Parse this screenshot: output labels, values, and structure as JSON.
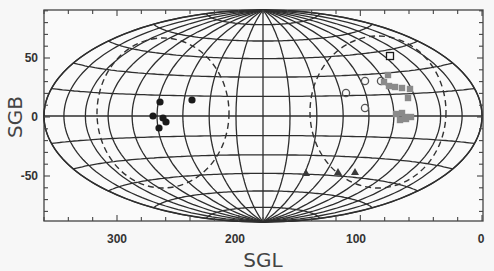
{
  "chart_data": {
    "type": "scatter",
    "projection": "aitoff-hammer (all-sky, elliptical)",
    "title": "",
    "xlabel": "SGL",
    "ylabel": "SGB",
    "xlim": [
      360,
      0
    ],
    "ylim": [
      -90,
      90
    ],
    "x_ticks": [
      300,
      200,
      100,
      0
    ],
    "y_ticks": [
      50,
      0,
      -50
    ],
    "x_tick_labels": [
      "300",
      "200",
      "100",
      "0"
    ],
    "y_tick_labels": [
      "50",
      "0",
      "-50"
    ],
    "grid": true,
    "grid_meridian_step_deg": 20,
    "grid_parallel_step_deg": 15,
    "legend": null,
    "dashed_regions": [
      {
        "name": "left-dashed-circle",
        "center_sgl": 262,
        "center_sgb": 0,
        "style": "dashed"
      },
      {
        "name": "right-dashed-circle",
        "center_sgl": 82,
        "center_sgb": 0,
        "style": "dashed"
      }
    ],
    "series": [
      {
        "name": "filled-black-circles",
        "marker": "filled-circle",
        "color": "#1a1a1a",
        "points_px": [
          [
            160,
            102
          ],
          [
            192,
            100
          ],
          [
            153,
            116
          ],
          [
            163,
            118
          ],
          [
            166,
            122
          ],
          [
            159,
            128
          ]
        ],
        "approx_sgl_sgb": [
          [
            268,
            13
          ],
          [
            240,
            15
          ],
          [
            273,
            0
          ],
          [
            265,
            -1
          ],
          [
            262,
            -5
          ],
          [
            268,
            -10
          ]
        ]
      },
      {
        "name": "open-circles",
        "marker": "open-circle",
        "color": "#555555",
        "points_px": [
          [
            365,
            81
          ],
          [
            381,
            81
          ],
          [
            346,
            93
          ],
          [
            365,
            108
          ]
        ],
        "approx_sgl_sgb": [
          [
            100,
            30
          ],
          [
            88,
            30
          ],
          [
            112,
            20
          ],
          [
            97,
            8
          ]
        ]
      },
      {
        "name": "open-square",
        "marker": "open-square",
        "color": "#1a1a1a",
        "points_px": [
          [
            390,
            56
          ]
        ],
        "approx_sgl_sgb": [
          [
            82,
            52
          ]
        ]
      },
      {
        "name": "gray-squares",
        "marker": "filled-square",
        "color": "#8a8a8a",
        "points_px": [
          [
            388,
            75
          ],
          [
            384,
            82
          ],
          [
            389,
            86
          ],
          [
            395,
            87
          ],
          [
            402,
            88
          ],
          [
            410,
            89
          ],
          [
            408,
            98
          ],
          [
            402,
            113
          ],
          [
            396,
            114
          ],
          [
            405,
            117
          ],
          [
            411,
            117
          ],
          [
            400,
            120
          ],
          [
            406,
            119
          ]
        ],
        "approx_sgl_sgb": [
          [
            80,
            35
          ],
          [
            84,
            29
          ],
          [
            80,
            26
          ],
          [
            74,
            25
          ],
          [
            68,
            24
          ],
          [
            60,
            23
          ],
          [
            62,
            16
          ],
          [
            68,
            3
          ],
          [
            74,
            2
          ],
          [
            66,
            0
          ],
          [
            60,
            0
          ],
          [
            70,
            -3
          ],
          [
            64,
            -2
          ]
        ]
      },
      {
        "name": "dark-triangles",
        "marker": "filled-triangle",
        "color": "#3a3a3a",
        "points_px": [
          [
            306,
            173
          ],
          [
            338,
            172
          ],
          [
            355,
            172
          ]
        ],
        "approx_sgl_sgb": [
          [
            145,
            -48
          ],
          [
            115,
            -48
          ],
          [
            100,
            -48
          ]
        ]
      }
    ]
  },
  "axes": {
    "x_title": "SGL",
    "y_title": "SGB",
    "x_labels": [
      "300",
      "200",
      "100",
      "0"
    ],
    "y_labels": [
      "50",
      "0",
      "-50"
    ]
  }
}
